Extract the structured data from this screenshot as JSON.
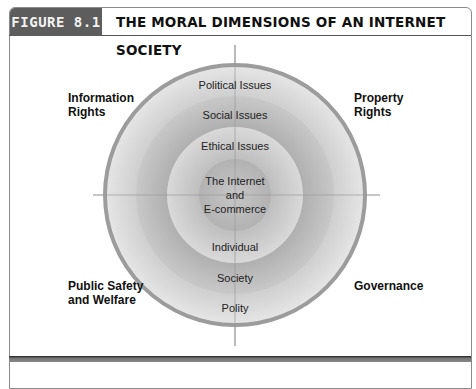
{
  "header": {
    "figure_label": "FIGURE 8.1",
    "title": "THE MORAL DIMENSIONS OF AN INTERNET SOCIETY"
  },
  "diagram": {
    "rings": [
      {
        "outer_label": "Political Issues",
        "inner_label": "Polity"
      },
      {
        "outer_label": "Social Issues",
        "inner_label": "Society"
      },
      {
        "outer_label": "Ethical Issues",
        "inner_label": "Individual"
      }
    ],
    "center": {
      "line1": "The Internet",
      "line2": "and",
      "line3": "E-commerce"
    },
    "quadrants": {
      "top_left": {
        "line1": "Information",
        "line2": "Rights"
      },
      "top_right": {
        "line1": "Property",
        "line2": "Rights"
      },
      "bottom_left": {
        "line1": "Public Safety",
        "line2": "and Welfare"
      },
      "bottom_right": {
        "line1": "Governance"
      }
    }
  }
}
